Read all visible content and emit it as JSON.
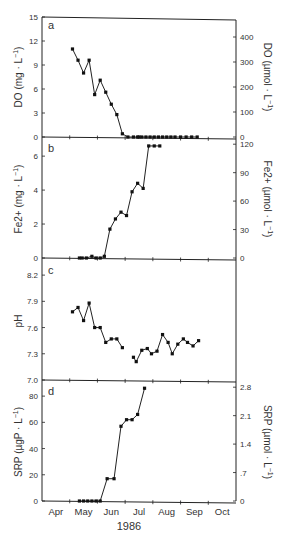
{
  "chart_data": [
    {
      "type": "line",
      "panel": "a",
      "ylabel": "DO (mg · L−1)",
      "ylabel_right": "DO (µmol · L−1)",
      "ylim": [
        0,
        15
      ],
      "yticks": [
        "0",
        "3",
        "6",
        "9",
        "12",
        "15"
      ],
      "yticks_right": [
        "0",
        "100",
        "200",
        "300",
        "400"
      ],
      "x_month": [
        4.6,
        4.8,
        5.0,
        5.2,
        5.4,
        5.6,
        5.8,
        6.0,
        6.2,
        6.4,
        6.6,
        6.8,
        6.95,
        7.0,
        7.1,
        7.25,
        7.4,
        7.55,
        7.7,
        7.85,
        8.0,
        8.15,
        8.3,
        8.5,
        8.7,
        8.9,
        9.1
      ],
      "values": [
        11.0,
        9.6,
        8.0,
        9.6,
        5.3,
        7.1,
        5.6,
        4.1,
        2.8,
        0.4,
        0.0,
        0.0,
        0.0,
        0.0,
        0.0,
        0.0,
        0.0,
        0.0,
        0.0,
        0.0,
        0.0,
        0.0,
        0.0,
        0.0,
        0.0,
        0.0,
        0.0
      ]
    },
    {
      "type": "line",
      "panel": "b",
      "ylabel": "Fe2+ (mg · L−1)",
      "ylabel_right": "Fe2+ (µmol · L−1)",
      "ylim": [
        0,
        6.8
      ],
      "yticks": [
        "0",
        "2",
        "4",
        "6"
      ],
      "yticks_right": [
        "0",
        "30",
        "60",
        "90",
        "120"
      ],
      "x_month": [
        4.85,
        4.95,
        5.1,
        5.3,
        5.45,
        5.6,
        5.75,
        5.95,
        6.15,
        6.35,
        6.55,
        6.75,
        6.95,
        7.15,
        7.35,
        7.55,
        7.75
      ],
      "values": [
        0.0,
        0.0,
        0.0,
        0.1,
        0.0,
        0.0,
        0.1,
        1.7,
        2.3,
        2.7,
        2.5,
        3.9,
        4.4,
        4.1,
        6.6,
        6.6,
        6.6
      ]
    },
    {
      "type": "line",
      "panel": "c",
      "ylabel": "pH",
      "ylim": [
        7.0,
        8.3
      ],
      "yticks": [
        "7.0",
        "7.3",
        "7.6",
        "7.9",
        "8.2"
      ],
      "segments": [
        {
          "x_month": [
            4.6,
            4.8,
            5.0,
            5.2,
            5.4,
            5.6,
            5.8,
            6.0,
            6.2,
            6.4
          ],
          "values": [
            7.78,
            7.83,
            7.68,
            7.88,
            7.6,
            7.6,
            7.43,
            7.47,
            7.47,
            7.37
          ]
        },
        {
          "x_month": [
            6.8,
            6.9,
            7.1,
            7.3,
            7.45,
            7.65,
            7.85,
            8.05,
            8.2,
            8.4,
            8.6,
            8.75,
            8.95,
            9.15
          ],
          "values": [
            7.26,
            7.21,
            7.34,
            7.36,
            7.3,
            7.33,
            7.52,
            7.43,
            7.3,
            7.41,
            7.47,
            7.43,
            7.39,
            7.45
          ]
        }
      ]
    },
    {
      "type": "line",
      "panel": "d",
      "ylabel": "SRP (µgP · L−1)",
      "ylabel_right": "SRP (µmol · L−1)",
      "ylim": [
        0,
        90
      ],
      "yticks": [
        "0",
        "20",
        "40",
        "60",
        "80"
      ],
      "yticks_right": [
        "0",
        ".7",
        "1.4",
        "2.1",
        "2.8"
      ],
      "x_month": [
        4.85,
        5.0,
        5.15,
        5.3,
        5.45,
        5.6,
        5.85,
        6.1,
        6.35,
        6.55,
        6.75,
        6.95,
        7.2
      ],
      "values": [
        0,
        0,
        0,
        0,
        0,
        0,
        17,
        17,
        57,
        62,
        62,
        66,
        86
      ],
      "xlabel": "1986",
      "xtick_labels": [
        "Apr",
        "May",
        "Jun",
        "Jul",
        "Aug",
        "Sep",
        "Oct"
      ]
    }
  ],
  "panels": {
    "a": {
      "letter": "a",
      "ylabel": "DO (mg · L",
      "ylabel_sup": "−1",
      "ylabel_right": "DO (µmol · L",
      "ylabel_right_sup": "−1"
    },
    "b": {
      "letter": "b",
      "ylabel": "Fe2+ (mg · L",
      "ylabel_sup": "−1",
      "ylabel_right": "Fe2+ (µmol · L",
      "ylabel_right_sup": "−1"
    },
    "c": {
      "letter": "c",
      "ylabel": "pH"
    },
    "d": {
      "letter": "d",
      "ylabel": "SRP (µgP · L",
      "ylabel_sup": "−1",
      "ylabel_right": "SRP (µmol · L",
      "ylabel_right_sup": "−1"
    }
  },
  "xaxis": {
    "months": [
      "Apr",
      "May",
      "Jun",
      "Jul",
      "Aug",
      "Sep",
      "Oct"
    ],
    "year": "1986"
  }
}
